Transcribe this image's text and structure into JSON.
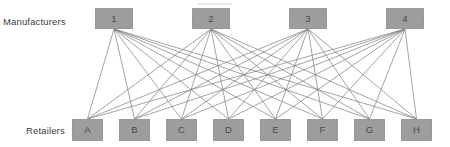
{
  "diagram": {
    "title": "",
    "type": "bipartite-graph",
    "background_color": "#ffffff",
    "node_fill_color": "#9d9d9d",
    "node_border_color": "#989898",
    "node_text_color": "#4a4a4a",
    "edge_color": "#7d7d7d",
    "label_text_color": "#3c3c3c"
  },
  "labels": {
    "manufacturers": "Manufacturers",
    "retailers": "Retailers"
  },
  "manufacturers": [
    {
      "id": "1",
      "label": "1",
      "x": 95,
      "y": 8
    },
    {
      "id": "2",
      "label": "2",
      "x": 192,
      "y": 8
    },
    {
      "id": "3",
      "label": "3",
      "x": 289,
      "y": 8
    },
    {
      "id": "4",
      "label": "4",
      "x": 386,
      "y": 8
    }
  ],
  "retailers": [
    {
      "id": "A",
      "label": "A",
      "x": 72,
      "y": 119
    },
    {
      "id": "B",
      "label": "B",
      "x": 119,
      "y": 119
    },
    {
      "id": "C",
      "label": "C",
      "x": 166,
      "y": 119
    },
    {
      "id": "D",
      "label": "D",
      "x": 213,
      "y": 119
    },
    {
      "id": "E",
      "label": "E",
      "x": 260,
      "y": 119
    },
    {
      "id": "F",
      "label": "F",
      "x": 307,
      "y": 119
    },
    {
      "id": "G",
      "label": "G",
      "x": 354,
      "y": 119
    },
    {
      "id": "H",
      "label": "H",
      "x": 401,
      "y": 119
    }
  ],
  "edges": [
    {
      "from": "1",
      "to": "A"
    },
    {
      "from": "1",
      "to": "B"
    },
    {
      "from": "1",
      "to": "C"
    },
    {
      "from": "1",
      "to": "D"
    },
    {
      "from": "1",
      "to": "E"
    },
    {
      "from": "1",
      "to": "F"
    },
    {
      "from": "1",
      "to": "G"
    },
    {
      "from": "1",
      "to": "H"
    },
    {
      "from": "2",
      "to": "A"
    },
    {
      "from": "2",
      "to": "B"
    },
    {
      "from": "2",
      "to": "C"
    },
    {
      "from": "2",
      "to": "D"
    },
    {
      "from": "2",
      "to": "E"
    },
    {
      "from": "2",
      "to": "F"
    },
    {
      "from": "2",
      "to": "G"
    },
    {
      "from": "2",
      "to": "H"
    },
    {
      "from": "3",
      "to": "A"
    },
    {
      "from": "3",
      "to": "B"
    },
    {
      "from": "3",
      "to": "C"
    },
    {
      "from": "3",
      "to": "D"
    },
    {
      "from": "3",
      "to": "E"
    },
    {
      "from": "3",
      "to": "F"
    },
    {
      "from": "3",
      "to": "G"
    },
    {
      "from": "3",
      "to": "H"
    },
    {
      "from": "4",
      "to": "A"
    },
    {
      "from": "4",
      "to": "B"
    },
    {
      "from": "4",
      "to": "C"
    },
    {
      "from": "4",
      "to": "D"
    },
    {
      "from": "4",
      "to": "E"
    },
    {
      "from": "4",
      "to": "F"
    },
    {
      "from": "4",
      "to": "G"
    },
    {
      "from": "4",
      "to": "H"
    }
  ]
}
